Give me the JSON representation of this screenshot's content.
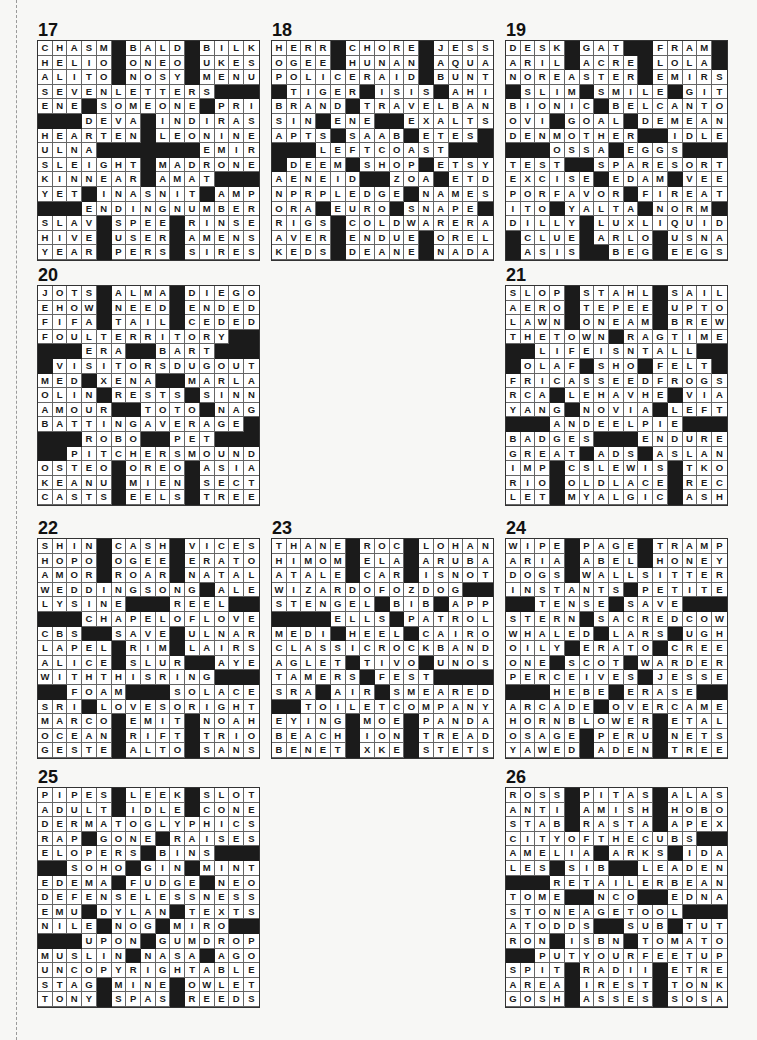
{
  "puzzles": [
    {
      "number": "17",
      "x": 37,
      "y": 21,
      "rows": [
        "CHASM#BALD#BILK",
        "HELIO#ONEO#UKES",
        "ALITO#NOSY#MENU",
        "SEVENLETTERS###",
        "ENE#SOMEONE#PRI",
        "###DEVA#INDIRAS",
        "HEARTEN#LEONINE",
        "ULNA#######EMIR",
        "SLEIGHT#MADRONE",
        "KINNEAR#AMAT###",
        "YET#INASNIT#AMP",
        "###ENDINGNUMBER",
        "SLAV#SPEE#RINSE",
        "HIVE#USER#AMENS",
        "YEAR#PERS#SIRES"
      ]
    },
    {
      "number": "18",
      "x": 271,
      "y": 21,
      "rows": [
        "HERR#CHORE#JESS",
        "OGEE#HUNAN#AQUA",
        "POLICERAID#BUNT",
        "#TIGER#ISIS#AHI",
        "BRAND#TRAVELBAN",
        "SIN#ENE##EXALTS",
        "APTS#SAAB#ETES#",
        "###LEFTCOAST###",
        "#DEEM#SHOP#ETSY",
        "AENEID##ZOA#ETD",
        "NPRPLEDGE#NAMES",
        "ORA#EURO#SNAPE#",
        "RIGS#COLDWARERA",
        "AVER#ENDUE#OREL",
        "KEDS#DEANE#NADA"
      ]
    },
    {
      "number": "19",
      "x": 505,
      "y": 21,
      "rows": [
        "DESK#GAT##FRAM#",
        "ARIL#ACRE#LOLA#",
        "NOREASTER#EMIRS",
        "#SLIM#SMILE#GIT",
        "BIONIC#BELCANTO",
        "OVI#GOAL#DEMEAN",
        "DENMOTHER##IDLE",
        "###OSSA#EGGS###",
        "TEST##SPARESORT",
        "EXCISE#EDAM#VEE",
        "PORFAVOR#FIREAT",
        "ITO#YALTA#NORM#",
        "DILLY#LUXLIQUID",
        "#CLUE#ARLO#USNA",
        "#ASIS##BEG#EEGS"
      ]
    },
    {
      "number": "20",
      "x": 37,
      "y": 266,
      "rows": [
        "JOTS#ALMA#DIEGO",
        "EHOW#NEED#ENDED",
        "FIFA#TAIL#CEDED",
        "FOULTERRITORY##",
        "###ERA##BART###",
        "#VISITORSDUGOUT",
        "MED#XENA##MARLA",
        "OLIN#RESTS#SINN",
        "AMOUR##TOTO#NAG",
        "BATTINGAVERAGE#",
        "###ROBO##PET###",
        "##PITCHERSMOUND",
        "OSTEO#OREO#ASIA",
        "KEANU#MIEN#SECT",
        "CASTS#EELS#TREE"
      ]
    },
    {
      "number": "21",
      "x": 505,
      "y": 266,
      "rows": [
        "SLOP#STAHL#SAIL",
        "AERO#TEPEE#UPTO",
        "LAWN#ONEAM#BREW",
        "THETOWN#RAGTIME",
        "##LIFEISNTALL##",
        "#OLAF#SHO#FELT#",
        "FRICASSEEDFROGS",
        "RCA#LEHAVHE#VIA",
        "YANG#NOVIA#LEFT",
        "###ANDEELPIE###",
        "BADGES###ENDURE",
        "GREAT#ADS#ASLAN",
        "IMP#CSLEWIS#TKO",
        "RIO#OLDLACE#REC",
        "LET#MYALGIC#ASH"
      ]
    },
    {
      "number": "22",
      "x": 37,
      "y": 519,
      "rows": [
        "SHIN#CASH#VICES",
        "HOPO#OGEE#ERATO",
        "AMOR#ROAR#NATAL",
        "WEDDINGSONG#ALE",
        "LYSINE###REEL##",
        "###CHAPELOFLOVE",
        "CBS##SAVE#ULNAR",
        "LAPEL#RIM#LAIRS",
        "ALICE#SLUR##AYE",
        "WITHTHISRING###",
        "##FOAM###SOLACE",
        "SRI#LOVESORIGHT",
        "MARCO#EMIT#NOAH",
        "OCEAN#RIFT#TRIO",
        "GESTE#ALTO#SANS"
      ]
    },
    {
      "number": "23",
      "x": 271,
      "y": 519,
      "rows": [
        "THANE#ROC#LOHAN",
        "HIMOM#ELA#ARUBA",
        "ATALE#CAR#ISNOT",
        "WIZARDOFOZDOG##",
        "STENGEL#BIB#APP",
        "####ELLS#PATROL",
        "MEDI#HEEL#CAIRO",
        "CLASSICROCKBAND",
        "AGLET#TIVO#UNOS",
        "TAMERS#FEST####",
        "SRA#AIR#SMEARED",
        "##TOILETCOMPANY",
        "EYING#MOE#PANDA",
        "BEACH#ION#TREAD",
        "BENET#XKE#STETS"
      ]
    },
    {
      "number": "24",
      "x": 505,
      "y": 519,
      "rows": [
        "WIPE#PAGE#TRAMP",
        "ARIA#ABEL#HONEY",
        "DOGS#WALLSITTER",
        "INSTANTS#PETITE",
        "##TENSE#SAVE###",
        "STERN#SACREDCOW",
        "WHALED#LARS#UGH",
        "OILY#ERATO#CREE",
        "ONE#SCOT#WARDER",
        "PERCEIVES#JESSE",
        "###HEBE#ERASE##",
        "ARCADE#OVERCAME",
        "HORNBLOWER#ETAL",
        "OSAGE#PERU#NETS",
        "YAWED#ADEN#TREE"
      ]
    },
    {
      "number": "25",
      "x": 37,
      "y": 768,
      "rows": [
        "PIPES#LEEK#SLOT",
        "ADULT#IDLE#CONE",
        "DERMATOGLYPHICS",
        "RAP#GONE#RAISES",
        "ELOPERS#BINS###",
        "##SOHO#GIN#MINT",
        "EDEMA#FUDGE#NEO",
        "DEFENSELESSNESS",
        "EMU#DYLAN#TEXTS",
        "NILE#NOG#MIRO##",
        "###UPON#GUMDROP",
        "MUSLIN#NASA#AGO",
        "UNCOPYRIGHTABLE",
        "STAG#MINE#OWLET",
        "TONY#SPAS#REEDS"
      ]
    },
    {
      "number": "26",
      "x": 505,
      "y": 768,
      "rows": [
        "ROSS#PITAS#ALAS",
        "ANTI#AMISH#HOBO",
        "STAB#RASTA#APEX",
        "CITYOFTHECUBS##",
        "AMELIA#ARKS#IDA",
        "LES#SIB##LEADEN",
        "###RETAILERBEAN",
        "TOME##NCO##EDNA",
        "STONEAGETOOL###",
        "ATODDS##SUB#TUT",
        "RON#ISBN#TOMATO",
        "##PUTYOURFEETUP",
        "SPIT#RADII#ETRE",
        "AREA#IREST#TONK",
        "GOSH#ASSES#SOSA"
      ]
    }
  ]
}
